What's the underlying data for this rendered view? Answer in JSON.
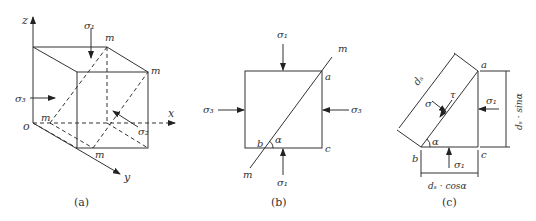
{
  "panels": [
    {
      "id": "a",
      "caption": "(a)",
      "axes": {
        "z": "z",
        "x": "x",
        "y": "y",
        "origin": "o"
      },
      "plane_label": "m",
      "stresses": {
        "top": "σ₁",
        "left": "σ₃",
        "inner": "σ₂"
      }
    },
    {
      "id": "b",
      "caption": "(b)",
      "plane_label": "m",
      "points": {
        "a": "a",
        "b": "b",
        "c": "c"
      },
      "angle": "α",
      "stresses": {
        "top": "σ₁",
        "bottom": "σ₁",
        "left": "σ₃",
        "right": "σ₃"
      }
    },
    {
      "id": "c",
      "caption": "(c)",
      "points": {
        "a": "a",
        "b": "b",
        "c": "c"
      },
      "angle": "α",
      "hypotenuse": "dₛ",
      "normal_stress": "σ",
      "shear_stress": "τ",
      "stresses": {
        "right": "σ₁",
        "bottom": "σ₁"
      },
      "dim_vertical": "dₛ · sinα",
      "dim_horizontal": "dₛ · cosα"
    }
  ]
}
